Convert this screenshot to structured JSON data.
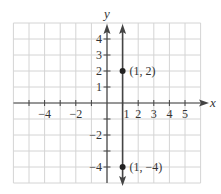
{
  "chart_data": {
    "type": "line",
    "title": "",
    "xlabel": "x",
    "ylabel": "y",
    "xlim": [
      -6,
      6
    ],
    "ylim": [
      -5,
      5
    ],
    "grid": true,
    "x_tick_labels": [
      "-4",
      "-2",
      "1",
      "2",
      "3",
      "4",
      "5"
    ],
    "y_tick_labels": [
      "4",
      "3",
      "2",
      "1",
      "-2",
      "-4"
    ],
    "series": [
      {
        "name": "x = 1",
        "kind": "vertical line",
        "x": 1,
        "arrows": "both ends"
      }
    ],
    "points": [
      {
        "x": 1,
        "y": 2,
        "label": "(1, 2)"
      },
      {
        "x": 1,
        "y": -4,
        "label": "(1, −4)"
      }
    ],
    "colors": {
      "grid": "#d4d4d4",
      "axes": "#444444",
      "line": "#444444",
      "points": "#222222"
    }
  }
}
